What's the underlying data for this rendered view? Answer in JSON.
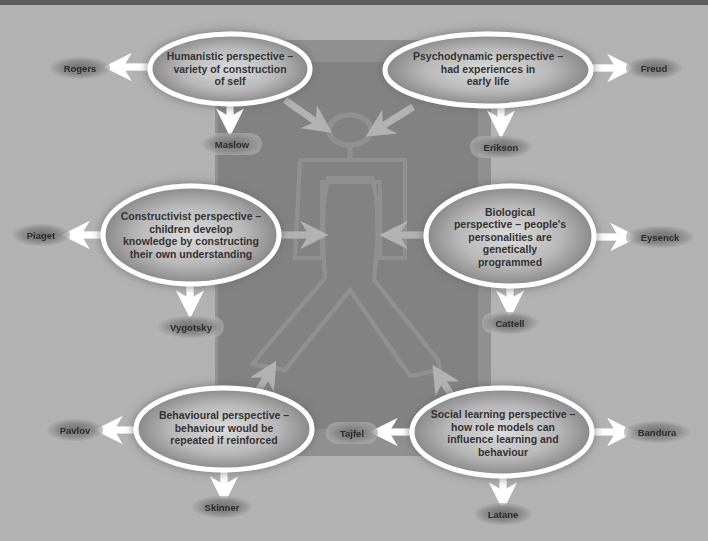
{
  "diagram": {
    "title": "",
    "center": {
      "label": "Person figure",
      "icon": "person-outline-icon"
    },
    "perspectives": [
      {
        "id": "humanistic",
        "text": "Humanistic perspective – variety of construction of self",
        "lines": [
          "Humanistic perspective –",
          "variety of construction",
          "of self"
        ],
        "theorists": [
          "Rogers",
          "Maslow"
        ]
      },
      {
        "id": "psychodynamic",
        "text": "Psychodynamic perspective – had experiences in early life",
        "lines": [
          "Psychodynamic perspective –",
          "had experiences in",
          "early life"
        ],
        "theorists": [
          "Freud",
          "Erikson"
        ]
      },
      {
        "id": "constructivist",
        "text": "Constructivist perspective – children develop knowledge by constructing their own understanding",
        "lines": [
          "Constructivist perspective –",
          "children develop",
          "knowledge by constructing",
          "their own understanding"
        ],
        "theorists": [
          "Piaget",
          "Vygotsky"
        ]
      },
      {
        "id": "biological",
        "text": "Biological perspective – people's personalities are genetically programmed",
        "lines": [
          "Biological",
          "perspective – people's",
          "personalities are",
          "genetically",
          "programmed"
        ],
        "theorists": [
          "Eysenck",
          "Cattell"
        ]
      },
      {
        "id": "behavioural",
        "text": "Behavioural perspective – behaviour would be repeated if reinforced",
        "lines": [
          "Behavioural perspective –",
          "behaviour would be",
          "repeated if reinforced"
        ],
        "theorists": [
          "Pavlov",
          "Skinner"
        ]
      },
      {
        "id": "social-learning",
        "text": "Social learning perspective – how role models can influence learning and behaviour",
        "lines": [
          "Social learning perspective –",
          "how role models can",
          "influence learning and",
          "behaviour"
        ],
        "theorists": [
          "Tajfel",
          "Bandura",
          "Latane"
        ]
      }
    ]
  },
  "colors": {
    "topbar": "#3a3a3a",
    "ellipse_center": "#d6d6d6",
    "ellipse_edge": "#7a7a7a",
    "outline": "#ffffff",
    "shadow": "#8a8a8a",
    "text": "#333333"
  }
}
